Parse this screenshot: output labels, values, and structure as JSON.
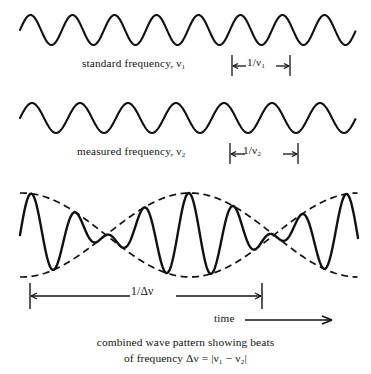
{
  "figure": {
    "title": "combined wave pattern showing beats",
    "background_color": "#ffffff",
    "stroke_color": "#111111"
  },
  "labels": {
    "wave1_label": "standard frequency, ν₁",
    "wave2_label": "measured frequency, ν₂",
    "period1_marker": "1/ν₁",
    "period2_marker": "1/ν₂",
    "beat_period_marker": "1/Δν",
    "time_axis_label": "time",
    "caption_line1": "combined wave pattern showing beats",
    "caption_line2": "of frequency Δν = |ν₁ − ν₂|"
  },
  "chart_data": {
    "type": "line",
    "title": "combined wave pattern showing beats",
    "subtitle": "of frequency Δν = |ν₁ − ν₂|",
    "xlabel": "time",
    "ylabel": "",
    "grid": false,
    "legend": "none",
    "panels": [
      {
        "name": "standard-frequency-wave",
        "label": "standard frequency, ν₁",
        "waveform": "sine",
        "cycles": 8,
        "period_px": 42,
        "amplitude_px": 15,
        "baseline_y": 30,
        "x_start": 20,
        "x_end": 356,
        "phase_deg": 0,
        "annotation": {
          "text": "1/ν₁",
          "x_start": 232,
          "x_end": 290,
          "y": 66,
          "style": "dimension-bar"
        }
      },
      {
        "name": "measured-frequency-wave",
        "label": "measured frequency, ν₂",
        "waveform": "sine",
        "cycles": 7,
        "period_px": 48,
        "amplitude_px": 15,
        "baseline_y": 118,
        "x_start": 20,
        "x_end": 356,
        "phase_deg": 0,
        "annotation": {
          "text": "1/ν₂",
          "x_start": 230,
          "x_end": 298,
          "y": 154,
          "style": "dimension-bar"
        }
      },
      {
        "name": "combined-beat-wave",
        "label": "combined wave pattern showing beats",
        "waveform": "beat",
        "carrier_period_px": 45,
        "envelope_period_px": 336,
        "amplitude_px": 42,
        "baseline_y": 235,
        "x_start": 20,
        "x_end": 358,
        "envelope_nodes_x": [
          178,
          356
        ],
        "envelope_antinodes_x": [
          22,
          268
        ],
        "envelope_style": "dashed",
        "annotation": {
          "text": "1/Δν",
          "x_start": 30,
          "x_end": 262,
          "y": 296,
          "style": "dimension-bar"
        }
      }
    ],
    "relations": [
      {
        "name": "beat_frequency",
        "expression": "Δν = |ν₁ − ν₂|"
      }
    ]
  }
}
